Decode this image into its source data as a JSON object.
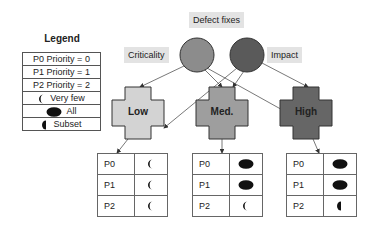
{
  "legend": {
    "title": "Legend",
    "rows": [
      {
        "text": "P0 Priority = 0",
        "symbol": ""
      },
      {
        "text": "P1 Priority = 1",
        "symbol": ""
      },
      {
        "text": "P2 Priority = 2",
        "symbol": ""
      },
      {
        "text": "Very few",
        "symbol": "very-few"
      },
      {
        "text": "All",
        "symbol": "all"
      },
      {
        "text": "Subset",
        "symbol": "subset"
      }
    ]
  },
  "root": {
    "label": "Defect fixes"
  },
  "factors": [
    {
      "label": "Criticality",
      "color": "#8c8c8c"
    },
    {
      "label": "Impact",
      "color": "#5a5a5a"
    }
  ],
  "levels": [
    {
      "label": "Low",
      "color": "#d3d3d3",
      "rows": [
        {
          "p": "P0",
          "symbol": "very-few"
        },
        {
          "p": "P1",
          "symbol": "very-few"
        },
        {
          "p": "P2",
          "symbol": "very-few"
        }
      ]
    },
    {
      "label": "Med.",
      "color": "#9e9e9e",
      "rows": [
        {
          "p": "P0",
          "symbol": "all"
        },
        {
          "p": "P1",
          "symbol": "all"
        },
        {
          "p": "P2",
          "symbol": "very-few"
        }
      ]
    },
    {
      "label": "High",
      "color": "#666666",
      "rows": [
        {
          "p": "P0",
          "symbol": "all"
        },
        {
          "p": "P1",
          "symbol": "all"
        },
        {
          "p": "P2",
          "symbol": "subset"
        }
      ]
    }
  ]
}
